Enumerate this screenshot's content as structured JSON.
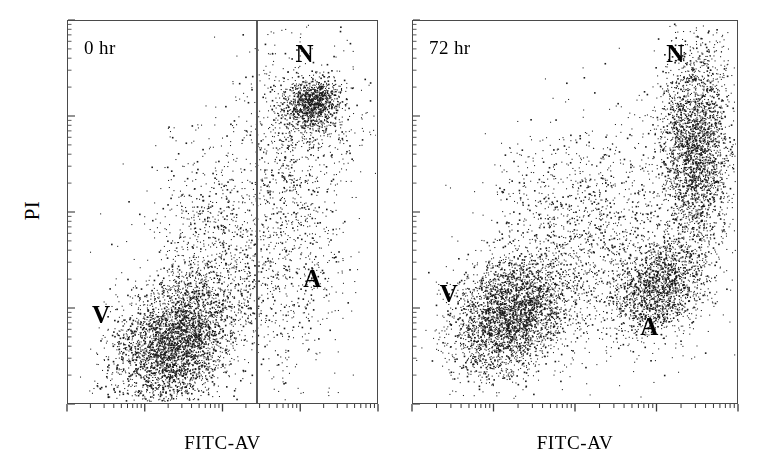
{
  "figure": {
    "type": "flow-cytometry-dot-plot",
    "panel_count": 2,
    "background_color": "#ffffff",
    "dot_color": "#1a1a1a",
    "frame_color": "#4a4a4a"
  },
  "axes": {
    "x_label": "FITC-AV",
    "y_label": "PI",
    "x_scale": "log",
    "y_scale": "log",
    "x_decades": 4,
    "y_decades": 4,
    "tick_minor_count_per_decade": 9,
    "gridlines": false
  },
  "panels": [
    {
      "id": "panel-0hr",
      "time_label": "0 hr",
      "frame": {
        "left": 67,
        "top": 20,
        "width": 311,
        "height": 384
      },
      "gate_x_fraction": 0.611,
      "x_axis_label": "FITC-AV",
      "quadrant_labels": [
        {
          "name": "N",
          "text": "N",
          "left_fraction": 0.735,
          "top_fraction": 0.055
        },
        {
          "name": "A",
          "text": "A",
          "left_fraction": 0.76,
          "top_fraction": 0.64
        },
        {
          "name": "V",
          "text": "V",
          "left_fraction": 0.08,
          "top_fraction": 0.735
        }
      ]
    },
    {
      "id": "panel-72hr",
      "time_label": "72 hr",
      "frame": {
        "left": 412,
        "top": 20,
        "width": 326,
        "height": 384
      },
      "gate_x_fraction": null,
      "x_axis_label": "FITC-AV",
      "quadrant_labels": [
        {
          "name": "N",
          "text": "N",
          "left_fraction": 0.78,
          "top_fraction": 0.055
        },
        {
          "name": "A",
          "text": "A",
          "left_fraction": 0.7,
          "top_fraction": 0.765
        },
        {
          "name": "V",
          "text": "V",
          "left_fraction": 0.085,
          "top_fraction": 0.68
        }
      ]
    }
  ],
  "chart_data": {
    "type": "scatter",
    "title": "",
    "xlabel": "FITC-AV",
    "ylabel": "PI",
    "xscale": "log",
    "yscale": "log",
    "xlim": [
      0,
      1
    ],
    "ylim": [
      0,
      1
    ],
    "legend": "none",
    "grid": false,
    "panels": [
      {
        "name": "0 hr",
        "gate_x": 0.611,
        "populations": [
          {
            "name": "V",
            "label": "V",
            "description": "viable cells, Annexin-V negative / PI low, dense diagonal streak lower-left",
            "n": 3400,
            "cx": 0.345,
            "cy": 0.845,
            "sx": 0.105,
            "sy": 0.075,
            "rotation_deg": -32,
            "shape": "elongated-diagonal",
            "density": "very-high"
          },
          {
            "name": "V-tail",
            "label": "",
            "description": "sparse upper tail of viable streak",
            "n": 620,
            "cx": 0.47,
            "cy": 0.6,
            "sx": 0.095,
            "sy": 0.11,
            "rotation_deg": -38,
            "shape": "diffuse",
            "density": "low"
          },
          {
            "name": "N",
            "label": "N",
            "description": "necrotic cells, PI high / Annexin-V high, compact dense blob upper-right",
            "n": 900,
            "cx": 0.79,
            "cy": 0.215,
            "sx": 0.045,
            "sy": 0.033,
            "rotation_deg": -12,
            "shape": "compact-round",
            "density": "very-high"
          },
          {
            "name": "N-halo",
            "label": "",
            "description": "diffuse scatter around necrotic blob",
            "n": 520,
            "cx": 0.76,
            "cy": 0.245,
            "sx": 0.105,
            "sy": 0.095,
            "rotation_deg": 0,
            "shape": "diffuse",
            "density": "low"
          },
          {
            "name": "A",
            "label": "A",
            "description": "apoptotic region, sparse column of events right of gate",
            "n": 780,
            "cx": 0.72,
            "cy": 0.56,
            "sx": 0.105,
            "sy": 0.2,
            "rotation_deg": 0,
            "shape": "vertical-column",
            "density": "low"
          },
          {
            "name": "background",
            "label": "",
            "description": "sparse background events across plot",
            "n": 300,
            "cx": 0.56,
            "cy": 0.52,
            "sx": 0.25,
            "sy": 0.26,
            "rotation_deg": 0,
            "shape": "uniform-sparse",
            "density": "very-low"
          }
        ]
      },
      {
        "name": "72 hr",
        "gate_x": null,
        "populations": [
          {
            "name": "V",
            "label": "V",
            "description": "remaining viable cells, dense diagonal streak lower-left",
            "n": 3000,
            "cx": 0.3,
            "cy": 0.77,
            "sx": 0.098,
            "sy": 0.072,
            "rotation_deg": -30,
            "shape": "elongated-diagonal",
            "density": "very-high"
          },
          {
            "name": "A",
            "label": "A",
            "description": "apoptotic cells, Annexin-V high / PI intermediate, diagonal cluster right-middle",
            "n": 1500,
            "cx": 0.76,
            "cy": 0.7,
            "sx": 0.075,
            "sy": 0.055,
            "rotation_deg": -30,
            "shape": "elongated-diagonal",
            "density": "high"
          },
          {
            "name": "N",
            "label": "N",
            "description": "necrotic cells, very dense vertical band at right edge, upper half",
            "n": 2600,
            "cx": 0.875,
            "cy": 0.33,
            "sx": 0.055,
            "sy": 0.14,
            "rotation_deg": 0,
            "shape": "vertical-band",
            "density": "very-high"
          },
          {
            "name": "bridge",
            "label": "",
            "description": "diffuse diagonal bridge connecting viable and necrotic clusters",
            "n": 1100,
            "cx": 0.565,
            "cy": 0.56,
            "sx": 0.15,
            "sy": 0.15,
            "rotation_deg": -40,
            "shape": "diffuse-diagonal",
            "density": "medium"
          },
          {
            "name": "background",
            "label": "",
            "description": "sparse background events across plot",
            "n": 420,
            "cx": 0.52,
            "cy": 0.56,
            "sx": 0.27,
            "sy": 0.26,
            "rotation_deg": 0,
            "shape": "uniform-sparse",
            "density": "very-low"
          }
        ]
      }
    ]
  }
}
